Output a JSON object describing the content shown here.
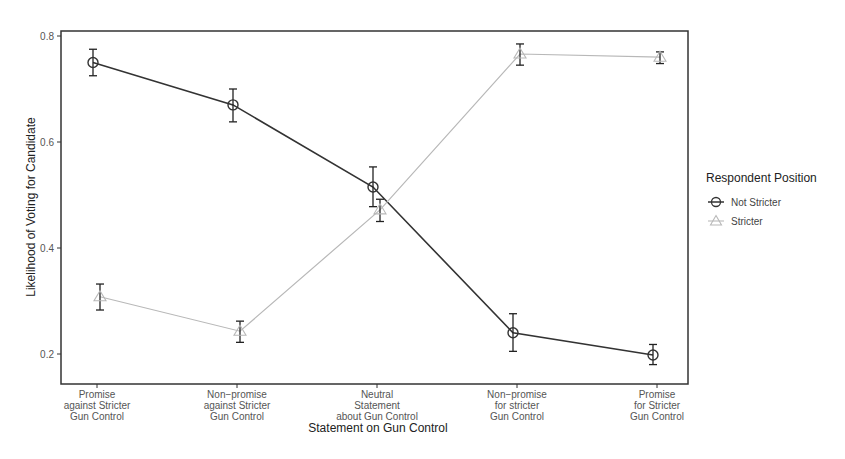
{
  "chart_data": {
    "type": "line",
    "title": "",
    "xlabel": "Statement on Gun Control",
    "ylabel": "Likelihood of Voting for Candidate",
    "categories": [
      [
        "Promise",
        "against Stricter",
        "Gun Control"
      ],
      [
        "Non−promise",
        "against Stricter",
        "Gun Control"
      ],
      [
        "Neutral",
        "Statement",
        "about Gun Control"
      ],
      [
        "Non−promise",
        "for stricter",
        "Gun Control"
      ],
      [
        "Promise",
        "for Stricter",
        "Gun Control"
      ]
    ],
    "yticks": [
      0.2,
      0.4,
      0.6,
      0.8
    ],
    "ylim": [
      0.14,
      0.81
    ],
    "grid": false,
    "legend": {
      "title": "Respondent Position",
      "position": "right",
      "entries": [
        "Not Stricter",
        "Stricter"
      ]
    },
    "series": [
      {
        "name": "Not Stricter",
        "marker": "circle",
        "color": "#333333",
        "values": [
          0.75,
          0.67,
          0.515,
          0.24,
          0.198
        ],
        "error_low": [
          0.725,
          0.638,
          0.478,
          0.205,
          0.18
        ],
        "error_high": [
          0.775,
          0.7,
          0.553,
          0.276,
          0.218
        ]
      },
      {
        "name": "Stricter",
        "marker": "triangle",
        "color": "#b8b8b8",
        "values": [
          0.308,
          0.243,
          0.472,
          0.766,
          0.76
        ],
        "error_low": [
          0.283,
          0.222,
          0.45,
          0.745,
          0.748
        ],
        "error_high": [
          0.332,
          0.262,
          0.492,
          0.785,
          0.77
        ]
      }
    ]
  }
}
